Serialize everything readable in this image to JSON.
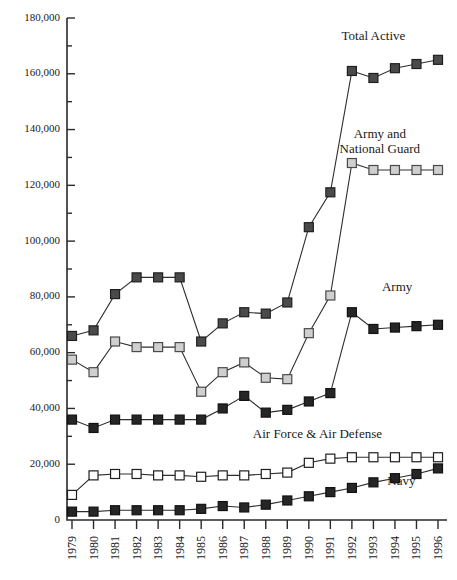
{
  "chart_data": {
    "type": "line",
    "title": "",
    "xlabel": "",
    "ylabel": "",
    "ylim": [
      0,
      180000
    ],
    "ytick_labels": [
      "180,000",
      "160,000",
      "140,000",
      "120,000",
      "100,000",
      "80,000",
      "60,000",
      "40,000",
      "20,000",
      "0"
    ],
    "ytick_values": [
      180000,
      160000,
      140000,
      120000,
      100000,
      80000,
      60000,
      40000,
      20000,
      0
    ],
    "grid": false,
    "legend": "inline-series-labels",
    "categories": [
      1979,
      1980,
      1981,
      1982,
      1983,
      1984,
      1985,
      1986,
      1987,
      1988,
      1989,
      1990,
      1991,
      1992,
      1993,
      1994,
      1995,
      1996
    ],
    "xtick_labels": [
      "1979",
      "1980",
      "1981",
      "1982",
      "1983",
      "1984",
      "1985",
      "1986",
      "1987",
      "1988",
      "1989",
      "1990",
      "1991",
      "1992",
      "1993",
      "1994",
      "1995",
      "1996"
    ],
    "series": [
      {
        "name": "Total Active",
        "marker": "filled-dark-square",
        "color": "#4a4a4a",
        "label_x": 1993.0,
        "label_y": 172000,
        "values": [
          66000,
          68000,
          81000,
          87000,
          87000,
          87000,
          64000,
          70500,
          74500,
          74000,
          78000,
          105000,
          117500,
          161000,
          158500,
          162000,
          163500,
          165000
        ]
      },
      {
        "name": "Army and National Guard",
        "marker": "light-gray-square",
        "color": "#c9c9c9",
        "label_x": 1993.3,
        "label_y": 137000,
        "values": [
          57500,
          53000,
          64000,
          62000,
          62000,
          62000,
          46000,
          53000,
          56500,
          51000,
          50500,
          67000,
          80500,
          128000,
          125500,
          125500,
          125500,
          125500
        ]
      },
      {
        "name": "Army",
        "marker": "filled-black-square",
        "color": "#2a2a2a",
        "label_x": 1994.1,
        "label_y": 82000,
        "values": [
          36000,
          33000,
          36000,
          36000,
          36000,
          36000,
          36000,
          40000,
          44500,
          38500,
          39500,
          42500,
          45500,
          74500,
          68500,
          69000,
          69500,
          70000
        ]
      },
      {
        "name": "Air Force & Air Defense",
        "marker": "open-white-square",
        "color": "#ffffff",
        "label_x": 1990.4,
        "label_y": 29500,
        "values": [
          9000,
          16000,
          16500,
          16500,
          16000,
          16000,
          15500,
          16000,
          16000,
          16500,
          17000,
          20500,
          22000,
          22500,
          22500,
          22500,
          22500,
          22500
        ]
      },
      {
        "name": "Navy",
        "marker": "filled-black-square",
        "color": "#1a1a1a",
        "label_x": 1994.3,
        "label_y": 12500,
        "values": [
          3000,
          3000,
          3500,
          3500,
          3500,
          3500,
          4000,
          5000,
          4500,
          5500,
          7000,
          8500,
          10000,
          11500,
          13500,
          15000,
          16500,
          18500
        ]
      }
    ]
  }
}
